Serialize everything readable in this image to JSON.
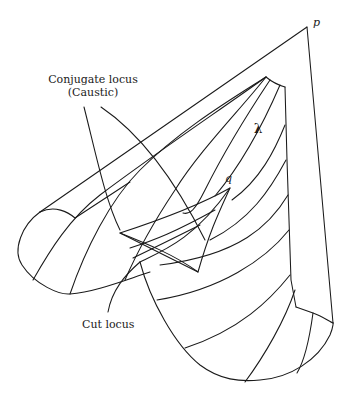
{
  "diagram": {
    "labels": {
      "point_p": "p",
      "point_q": "q",
      "geodesic_lambda": "λ",
      "conjugate_locus_line1": "Conjugate locus",
      "conjugate_locus_line2": "(Caustic)",
      "cut_locus": "Cut locus"
    },
    "colors": {
      "stroke": "#1a1a1a",
      "background": "#ffffff"
    }
  }
}
